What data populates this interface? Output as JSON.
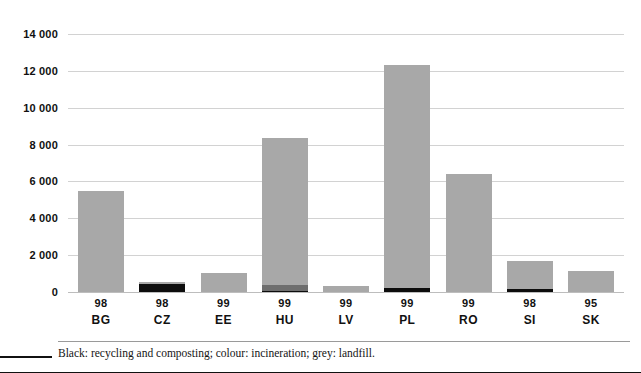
{
  "figure": {
    "footnote": "Black: recycling and composting; colour: incineration; grey: landfill."
  },
  "colors": {
    "landfill": "#a8a8a8",
    "incineration": "#6e6e6e",
    "recycling": "#0d0d0d",
    "gridline": "#d2d2d2",
    "text": "#111111",
    "background": "#ffffff"
  },
  "chart_data": {
    "type": "bar",
    "title": "",
    "subtitle": "",
    "xlabel": "",
    "ylabel": "",
    "stacked": true,
    "grid": true,
    "legend_position": "footnote",
    "ylim": [
      0,
      14000
    ],
    "ytick_step": 2000,
    "ytick_labels": [
      "14 000",
      "12 000",
      "10 000",
      "8 000",
      "6 000",
      "4 000",
      "2 000",
      "0"
    ],
    "ytick_values": [
      14000,
      12000,
      10000,
      8000,
      6000,
      4000,
      2000,
      0
    ],
    "categories": [
      "BG",
      "CZ",
      "EE",
      "HU",
      "LV",
      "PL",
      "RO",
      "SI",
      "SK"
    ],
    "years": [
      "98",
      "98",
      "99",
      "99",
      "99",
      "99",
      "99",
      "98",
      "95"
    ],
    "series": [
      {
        "name": "recycling and composting",
        "color": "#0d0d0d",
        "values": [
          0,
          430,
          0,
          80,
          0,
          200,
          0,
          170,
          0
        ]
      },
      {
        "name": "incineration",
        "color": "#6e6e6e",
        "values": [
          0,
          0,
          0,
          320,
          0,
          0,
          0,
          0,
          0
        ]
      },
      {
        "name": "landfill",
        "color": "#a8a8a8",
        "values": [
          5500,
          120,
          1050,
          7950,
          310,
          12100,
          6400,
          1530,
          1120
        ]
      }
    ],
    "totals": [
      5500,
      550,
      1050,
      8350,
      310,
      12300,
      6400,
      1700,
      1120
    ]
  }
}
